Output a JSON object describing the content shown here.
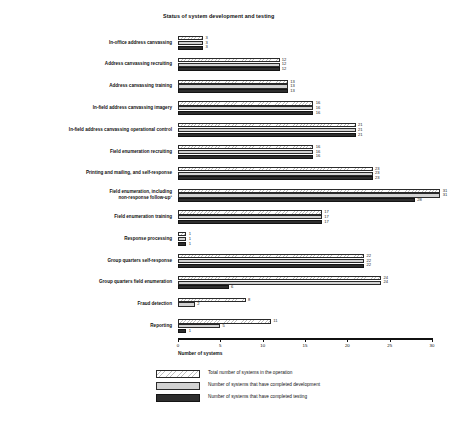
{
  "chart_data": {
    "type": "bar",
    "orientation": "horizontal",
    "title": "Status of system development and testing",
    "xlabel": "Number of systems",
    "ylabel": "",
    "xlim": [
      0,
      30
    ],
    "xticks": [
      0,
      5,
      10,
      15,
      20,
      25,
      30
    ],
    "grid": false,
    "legend_position": "bottom",
    "categories": [
      "In-office address canvassing",
      "Address canvassing recruiting",
      "Address canvassing training",
      "In-field address canvassing imagery",
      "In-field address canvassing operational control",
      "Field enumeration recruiting",
      "Printing and mailing, and self-response",
      "Field enumeration, including\nnon-response follow-up¹",
      "Field enumeration training",
      "Response processing",
      "Group quarters self-response",
      "Group quarters field enumeration",
      "Fraud detection",
      "Reporting"
    ],
    "series": [
      {
        "name": "Total number of systems in the operation",
        "color": "#ffffff",
        "pattern": "hatched",
        "values": [
          3,
          12,
          13,
          16,
          21,
          16,
          23,
          31,
          17,
          1,
          22,
          24,
          8,
          11
        ]
      },
      {
        "name": "Number of systems that have completed development",
        "color": "#d2d2d2",
        "pattern": "solid-light",
        "values": [
          3,
          12,
          13,
          16,
          21,
          16,
          23,
          31,
          17,
          1,
          22,
          24,
          2,
          5
        ]
      },
      {
        "name": "Number of systems that have completed testing",
        "color": "#2e2e2e",
        "pattern": "solid-dark",
        "values": [
          3,
          12,
          13,
          16,
          21,
          16,
          23,
          28,
          17,
          1,
          22,
          6,
          0,
          1
        ]
      }
    ],
    "value_labels": [
      [
        "3",
        "3",
        "3"
      ],
      [
        "12",
        "12",
        "12"
      ],
      [
        "13",
        "13",
        "13"
      ],
      [
        "16",
        "16",
        "16"
      ],
      [
        "21",
        "21",
        "21"
      ],
      [
        "16",
        "16",
        "16"
      ],
      [
        "23",
        "23",
        "23"
      ],
      [
        "31",
        "31",
        "28"
      ],
      [
        "17",
        "17",
        "17"
      ],
      [
        "1",
        "1",
        "1"
      ],
      [
        "22",
        "22",
        "22"
      ],
      [
        "24",
        "24",
        "6"
      ],
      [
        "8",
        "2",
        ""
      ],
      [
        "11",
        "5",
        "1"
      ]
    ]
  },
  "axis": {
    "tick_labels": [
      "0",
      "5",
      "10",
      "15",
      "20",
      "25",
      "30"
    ],
    "title": "Number of systems"
  },
  "legend": {
    "items": [
      {
        "label": "Total number of systems in the operation"
      },
      {
        "label": "Number of systems that have completed development"
      },
      {
        "label": "Number of systems that have completed testing"
      }
    ]
  }
}
